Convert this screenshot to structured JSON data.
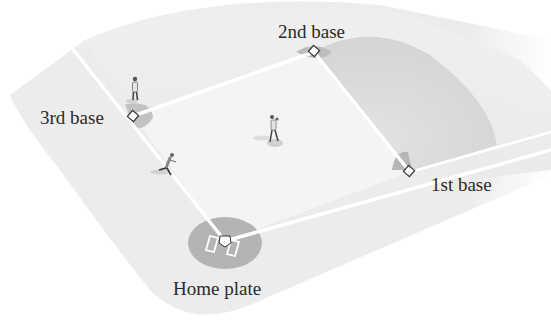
{
  "diagram": {
    "type": "baseball-diamond",
    "colors": {
      "background": "#ffffff",
      "field_outer": "#ececec",
      "infield": "#f3f3f3",
      "outfield_shadow": "#d8d8d8",
      "dirt": "#b9b9b9",
      "base_lines": "#ffffff",
      "base_outline": "#333333",
      "text": "#2a2a2a"
    },
    "labels": {
      "second_base": "2nd base",
      "third_base": "3rd base",
      "first_base": "1st base",
      "home_plate": "Home plate"
    },
    "bases": [
      {
        "name": "home-plate",
        "x": 225,
        "y": 241
      },
      {
        "name": "first-base",
        "x": 410,
        "y": 172
      },
      {
        "name": "second-base",
        "x": 314,
        "y": 52
      },
      {
        "name": "third-base",
        "x": 133,
        "y": 116
      }
    ],
    "players": [
      {
        "role": "third-baseman",
        "x": 135,
        "y": 92
      },
      {
        "role": "shortstop",
        "x": 172,
        "y": 162
      },
      {
        "role": "pitcher",
        "x": 272,
        "y": 130
      }
    ]
  }
}
